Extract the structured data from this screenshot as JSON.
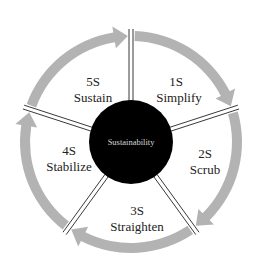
{
  "diagram": {
    "type": "cycle",
    "center": {
      "label": "Sustainability",
      "fill": "#000000",
      "text_color": "#d8d8d8"
    },
    "ring": {
      "arrow_color": "#b3b3b3",
      "direction": "clockwise"
    },
    "segments": [
      {
        "id": "1S",
        "code": "1S",
        "name": "Simplify"
      },
      {
        "id": "2S",
        "code": "2S",
        "name": "Scrub"
      },
      {
        "id": "3S",
        "code": "3S",
        "name": "Straighten"
      },
      {
        "id": "4S",
        "code": "4S",
        "name": "Stabilize"
      },
      {
        "id": "5S",
        "code": "5S",
        "name": "Sustain"
      }
    ]
  }
}
